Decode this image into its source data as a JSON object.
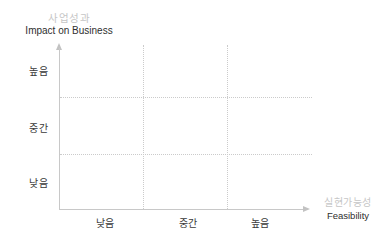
{
  "chart": {
    "y_axis_title_ko": "사업성과",
    "y_axis_title_en": "Impact on Business",
    "x_axis_title_ko": "실현가능성",
    "x_axis_title_en": "Feasibility",
    "y_ticks": [
      "높음",
      "중간",
      "낮음"
    ],
    "x_ticks": [
      "낮음",
      "중간",
      "높음"
    ],
    "colors": {
      "muted_label": "#c6c6c6",
      "text": "#2e2e2e",
      "tick_text": "#3a3a3a",
      "axis_line": "#c8c8c8",
      "grid_line": "#cbcbcb",
      "background": "#ffffff"
    }
  },
  "chart_data": {
    "type": "scatter",
    "title": "",
    "xlabel": "실현가능성 (Feasibility)",
    "ylabel": "사업성과 (Impact on Business)",
    "x_tick_labels": [
      "낮음",
      "중간",
      "높음"
    ],
    "y_tick_labels_top_to_bottom": [
      "높음",
      "중간",
      "낮음"
    ],
    "series": [],
    "grid": "3x3 dotted-line matrix, no data points plotted",
    "legend_position": "none",
    "axis_style": "light gray arrows on top of y-axis and right of x-axis"
  }
}
